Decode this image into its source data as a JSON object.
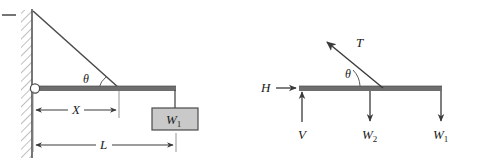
{
  "figure": {
    "background_color": "#ffffff",
    "line_color": "#3a3a3a",
    "beam_color": "#6e6e6e",
    "block_fill": "#c9c9c9",
    "block_stroke": "#4a4a4a",
    "hatch_color": "#8a8a8a"
  },
  "left_diagram": {
    "name": "cantilever-beam-with-cable",
    "labels": {
      "angle": "θ",
      "dimension_x": "X",
      "dimension_l": "L",
      "weight_block": "W",
      "weight_block_sub": "1"
    },
    "elements": {
      "wall": "hatched-wall",
      "pin": "pin-support",
      "cable": "diagonal-cable",
      "beam": "horizontal-beam",
      "hanger": "vertical-hanger-line",
      "block": "suspended-weight-block",
      "dim_x": "dimension-line-x",
      "dim_l": "dimension-line-l",
      "tick_x": "extension-tick-x",
      "tick_l": "extension-tick-l",
      "corner_dash": "corner-dash-mark"
    }
  },
  "right_diagram": {
    "name": "free-body-diagram",
    "labels": {
      "tension": "T",
      "angle": "θ",
      "horizontal_reaction": "H",
      "vertical_reaction": "V",
      "weight_two": "W",
      "weight_two_sub": "2",
      "weight_one": "W",
      "weight_one_sub": "1"
    },
    "elements": {
      "beam": "horizontal-beam",
      "tension_vector": "tension-force-arrow",
      "h_vector": "horizontal-reaction-arrow",
      "v_vector": "vertical-reaction-arrow",
      "w2_vector": "weight-two-arrow",
      "w1_vector": "weight-one-arrow",
      "angle_arc": "angle-arc"
    }
  }
}
